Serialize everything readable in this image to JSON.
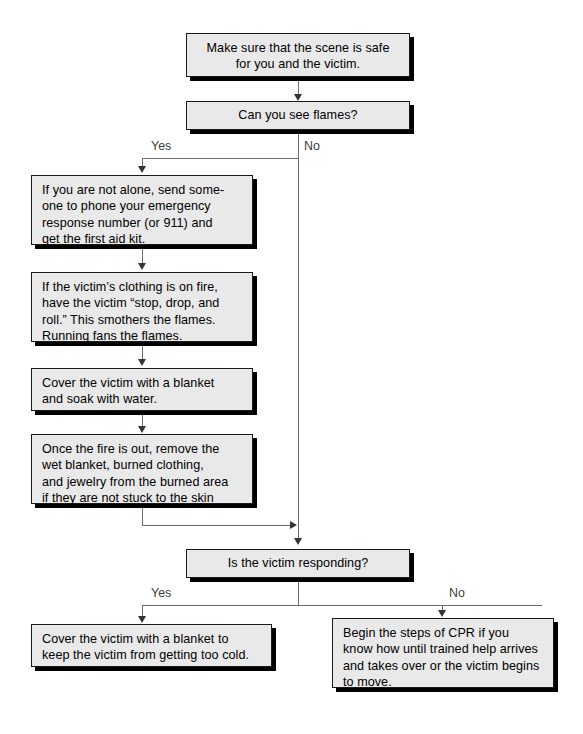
{
  "diagram": {
    "background_color": "#ffffff",
    "box_fill_color": "#e9e9e9",
    "box_border_color": "#1a1a1a",
    "shadow_color": "#000000",
    "connector_color": "#6e6e6e",
    "label_color": "#3c3c3c"
  },
  "nodes": {
    "scene_safe": {
      "text": "Make sure that the scene is safe\nfor you and the victim."
    },
    "see_flames": {
      "text": "Can you see flames?"
    },
    "call_help": {
      "text": "If you are not alone, send some-\none to phone your emergency\nresponse number (or 911) and\nget the first aid kit."
    },
    "stop_drop_roll": {
      "text": "If the victim’s clothing is on fire,\nhave the victim “stop, drop, and\nroll.” This smothers the flames.\nRunning fans the flames."
    },
    "cover_soak": {
      "text": "Cover the victim with a blanket\nand soak with water."
    },
    "remove_items": {
      "text": "Once the fire is out, remove the\nwet blanket, burned clothing,\nand jewelry from the burned area\nif they are not stuck to the skin"
    },
    "victim_responding": {
      "text": "Is the victim responding?"
    },
    "cover_warm": {
      "text": "Cover the victim with a blanket to\nkeep the victim from getting too cold."
    },
    "begin_cpr": {
      "text": "Begin the steps of CPR if you\nknow how until trained help arrives\nand takes over or the victim begins\nto move."
    }
  },
  "branch_labels": {
    "flames_yes": "Yes",
    "flames_no": "No",
    "responding_yes": "Yes",
    "responding_no": "No"
  }
}
